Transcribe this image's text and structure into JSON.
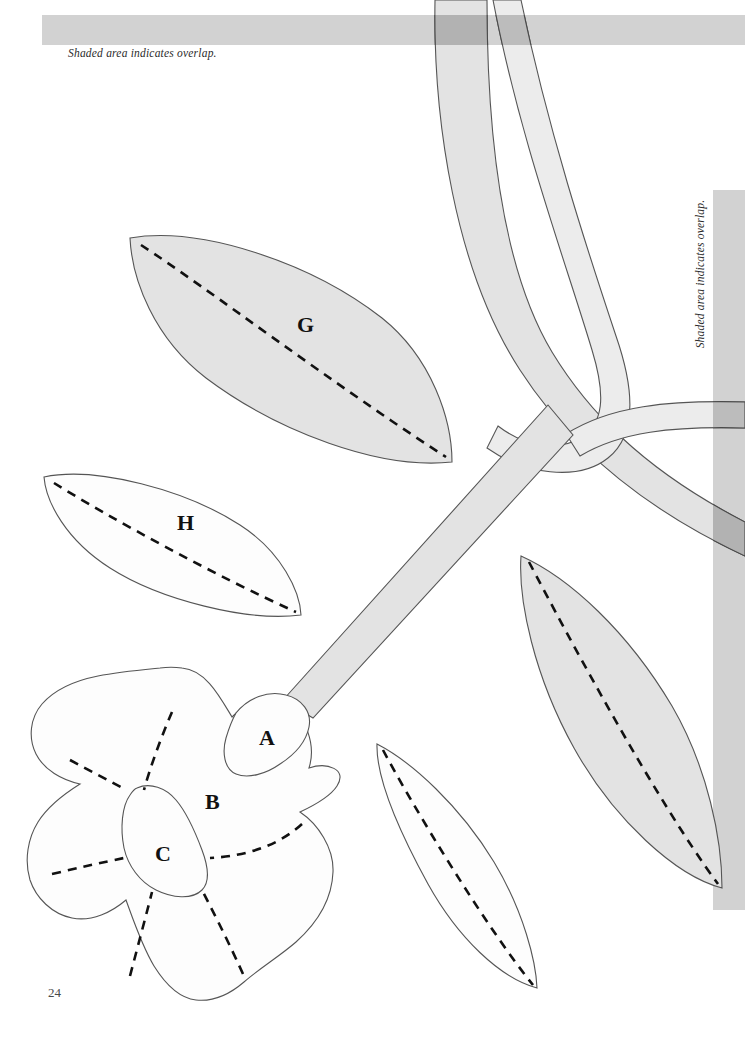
{
  "page": {
    "number": "24",
    "background_color": "#ffffff",
    "width": 745,
    "height": 1041
  },
  "captions": {
    "top": "Shaded area indicates overlap.",
    "right": "Shaded area indicates overlap."
  },
  "colors": {
    "shaded_fill": "#e3e3e3",
    "unshaded_fill": "#fdfdfd",
    "bar_fill": "#d2d2d2",
    "overlap_dark": "#b9b9b9",
    "outline": "#555555",
    "dash_line": "#111111",
    "label_text": "#111111",
    "caption_text": "#2b2b2b"
  },
  "pieces": [
    {
      "id": "A",
      "label": "A",
      "shaded": false,
      "kind": "calyx-piece",
      "x": 259,
      "y": 728
    },
    {
      "id": "B",
      "label": "B",
      "shaded": false,
      "kind": "flower-petal-base",
      "x": 205,
      "y": 806
    },
    {
      "id": "C",
      "label": "C",
      "shaded": false,
      "kind": "flower-center",
      "x": 155,
      "y": 865
    },
    {
      "id": "G",
      "label": "G",
      "shaded": true,
      "kind": "leaf",
      "x": 297,
      "y": 335
    },
    {
      "id": "H",
      "label": "H",
      "shaded": false,
      "kind": "leaf",
      "x": 177,
      "y": 535
    }
  ],
  "unlabeled_shapes": [
    {
      "kind": "leaf",
      "shaded": true,
      "position": "right-middle"
    },
    {
      "kind": "leaf",
      "shaded": false,
      "position": "lower-center"
    },
    {
      "kind": "stem-band",
      "shaded": true,
      "position": "top-left-curving"
    },
    {
      "kind": "stem-band",
      "shaded": true,
      "position": "top-right-curving"
    },
    {
      "kind": "stem-band",
      "shaded": true,
      "position": "right-arc"
    },
    {
      "kind": "stem-band",
      "shaded": true,
      "position": "diagonal-to-flower"
    }
  ],
  "margin_bars": [
    {
      "name": "top-bar",
      "orientation": "horizontal",
      "x": 42,
      "y": 15,
      "w": 703,
      "h": 30
    },
    {
      "name": "right-bar",
      "orientation": "vertical",
      "x": 713,
      "y": 190,
      "w": 32,
      "h": 720
    }
  ]
}
